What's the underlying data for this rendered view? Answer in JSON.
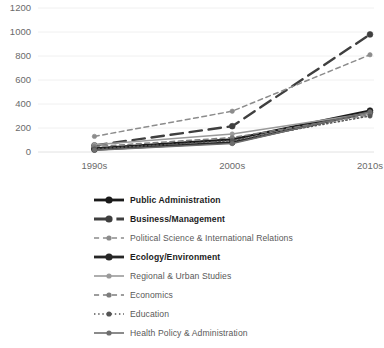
{
  "chart_data": {
    "type": "line",
    "title": "",
    "xlabel": "",
    "ylabel": "",
    "categories": [
      "1990s",
      "2000s",
      "2010s"
    ],
    "ylim": [
      0,
      1200
    ],
    "yticks": [
      0,
      200,
      400,
      600,
      800,
      1000,
      1200
    ],
    "grid": true,
    "legend_position": "bottom",
    "series": [
      {
        "name": "Public Administration",
        "values": [
          30,
          105,
          345
        ],
        "color": "#1a1a1a",
        "style": "solid",
        "emphasis": "bold"
      },
      {
        "name": "Business/Management",
        "values": [
          55,
          215,
          980
        ],
        "color": "#3f3f3f",
        "style": "long-dash",
        "emphasis": "bold"
      },
      {
        "name": "Political Science & International Relations",
        "values": [
          130,
          340,
          810
        ],
        "color": "#8c8c8c",
        "style": "dash",
        "emphasis": "normal"
      },
      {
        "name": "Ecology/Environment",
        "values": [
          20,
          80,
          330
        ],
        "color": "#262626",
        "style": "solid",
        "emphasis": "bold"
      },
      {
        "name": "Regional & Urban Studies",
        "values": [
          60,
          150,
          325
        ],
        "color": "#9a9a9a",
        "style": "solid",
        "emphasis": "normal"
      },
      {
        "name": "Economics",
        "values": [
          45,
          120,
          310
        ],
        "color": "#7d7d7d",
        "style": "dash",
        "emphasis": "normal"
      },
      {
        "name": "Education",
        "values": [
          25,
          95,
          300
        ],
        "color": "#555555",
        "style": "dot",
        "emphasis": "normal"
      },
      {
        "name": "Health Policy & Administration",
        "values": [
          15,
          70,
          335
        ],
        "color": "#6e6e6e",
        "style": "solid",
        "emphasis": "normal"
      }
    ]
  },
  "axis": {
    "y_labels": [
      "1200",
      "1000",
      "800",
      "600",
      "400",
      "200",
      "0"
    ],
    "x_labels": [
      "1990s",
      "2000s",
      "2010s"
    ]
  },
  "legend": {
    "items": [
      {
        "label": "Public Administration"
      },
      {
        "label": "Business/Management"
      },
      {
        "label": "Political Science & International Relations"
      },
      {
        "label": "Ecology/Environment"
      },
      {
        "label": "Regional & Urban Studies"
      },
      {
        "label": "Economics"
      },
      {
        "label": "Education"
      },
      {
        "label": "Health Policy & Administration"
      }
    ]
  }
}
